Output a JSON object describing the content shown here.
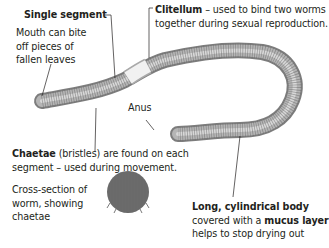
{
  "diagram": {
    "labels": {
      "single_segment": {
        "title": "Single segment",
        "desc_lines": [
          "Mouth can bite",
          "off pieces of",
          "fallen leaves"
        ]
      },
      "clitellum": {
        "title": "Clitellum",
        "line1_rest": " – used to bind two worms",
        "line2": "together during sexual reproduction."
      },
      "anus": {
        "text": "Anus"
      },
      "chaetae": {
        "title": "Chaetae",
        "line1_rest": " (bristles) are found on each",
        "line2": "segment – used during movement."
      },
      "cross_section": {
        "lines": [
          "Cross-section of",
          "worm, showing",
          "chaetae"
        ]
      },
      "body": {
        "title": "Long, cylindrical body",
        "line2_pre": "covered with a ",
        "line2_bold": "mucus layer",
        "line3": "helps to stop drying out"
      }
    },
    "colors": {
      "worm_body": "#8f8f8f",
      "worm_highlight": "#d6d6d6",
      "clitellum": "#eeeeee",
      "cross_section": "#6b6b6b",
      "leader_line": "#231f20",
      "text": "#231f20"
    }
  }
}
